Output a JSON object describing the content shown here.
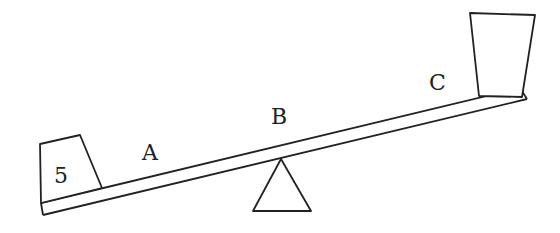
{
  "diagram": {
    "left_weight_label": "5",
    "point_labels": {
      "a": "A",
      "b": "B",
      "c": "C"
    },
    "stroke_color": "#222222",
    "background": "#ffffff"
  }
}
